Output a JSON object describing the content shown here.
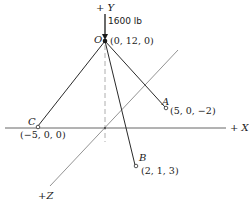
{
  "diagram": {
    "axes": {
      "y_label": "+ Y",
      "x_label": "+ X",
      "z_label": "+Z"
    },
    "load": {
      "label": "1600 lb"
    },
    "points": {
      "O": {
        "name": "O",
        "coords": "(0, 12, 0)"
      },
      "A": {
        "name": "A",
        "coords": "(5, 0, −2)"
      },
      "B": {
        "name": "B",
        "coords": "(2, 1, 3)"
      },
      "C": {
        "name": "C",
        "coords": "(−5, 0, 0)"
      }
    },
    "colors": {
      "member": "#2a2a2a",
      "axis": "#555555",
      "background": "#ffffff"
    }
  }
}
